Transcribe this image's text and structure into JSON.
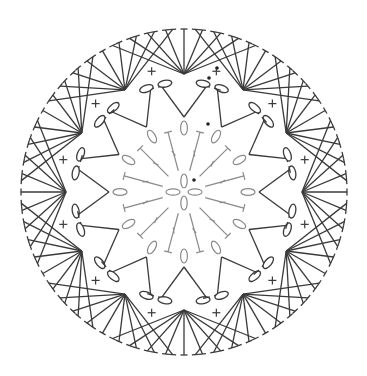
{
  "diagram": {
    "title": "",
    "type": "crochet-chart",
    "center": [
      184,
      192
    ],
    "colors": {
      "dark": "#3a3a3a",
      "gray": "#8a8a8a",
      "background": "#ffffff"
    },
    "round1": {
      "stitch": "double-crochet",
      "count": 12,
      "r_in": 22,
      "r_out": 62,
      "color": "gray"
    },
    "round1_chains": {
      "stitch": "chain",
      "count": 12,
      "radius": 64,
      "color": "gray"
    },
    "center_ring": {
      "stitch": "chain",
      "count": 4,
      "radius": 11,
      "color": "gray"
    },
    "round2": {
      "stitch": "double-crochet-v",
      "count": 12,
      "r_base": 75,
      "r_tip": 108,
      "color": "dark"
    },
    "round2_chains": {
      "stitch": "chain",
      "count": 24,
      "radius": 110,
      "color": "dark"
    },
    "round3_sc": {
      "stitch": "single-crochet",
      "count": 12,
      "radius": 125
    },
    "round3_fans": {
      "stitch": "treble-fan",
      "count": 12,
      "stitches_per_fan": 9,
      "r_in": 118,
      "r_out": 163,
      "spread_deg": 26
    },
    "start_marks": [
      [
        217,
        68
      ],
      [
        209,
        78
      ],
      [
        208,
        124
      ],
      [
        194,
        180
      ]
    ]
  }
}
